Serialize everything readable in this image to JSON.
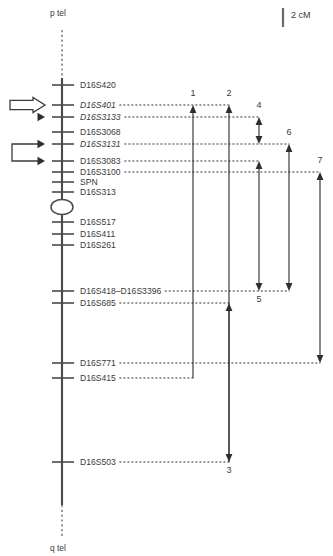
{
  "figure": {
    "type": "genetic-linkage-map",
    "chromosome_arms": {
      "top": "p tel",
      "bottom": "q tel"
    },
    "scale": {
      "label": "2 cM",
      "bar_length_cm": 2
    }
  },
  "chart_data": {
    "type": "diagram",
    "title": "",
    "subtitle": "",
    "xlabel": "",
    "ylabel": "",
    "scale_label": "2 cM",
    "telomere_top": "p tel",
    "telomere_bottom": "q tel",
    "centromere_present": true,
    "markers": [
      {
        "name": "D16S420",
        "y": 85,
        "italic": false,
        "has_leader": false
      },
      {
        "name": "D16S401",
        "y": 105,
        "italic": true,
        "has_leader": true
      },
      {
        "name": "D16S3133",
        "y": 117,
        "italic": true,
        "has_leader": true
      },
      {
        "name": "D16S3068",
        "y": 132,
        "italic": false,
        "has_leader": false
      },
      {
        "name": "D16S3131",
        "y": 144,
        "italic": true,
        "has_leader": true
      },
      {
        "name": "D16S3083",
        "y": 161,
        "italic": false,
        "has_leader": true
      },
      {
        "name": "D16S3100",
        "y": 172,
        "italic": false,
        "has_leader": true
      },
      {
        "name": "SPN",
        "y": 182,
        "italic": false,
        "has_leader": false
      },
      {
        "name": "D16S313",
        "y": 192,
        "italic": false,
        "has_leader": false
      },
      {
        "name": "D16S517",
        "y": 222,
        "italic": false,
        "has_leader": true
      },
      {
        "name": "D16S411",
        "y": 234,
        "italic": false,
        "has_leader": false
      },
      {
        "name": "D16S261",
        "y": 245,
        "italic": false,
        "has_leader": false
      },
      {
        "name": "D16S418–D16S3396",
        "y": 291,
        "italic": false,
        "has_leader": true
      },
      {
        "name": "D16S685",
        "y": 303,
        "italic": false,
        "has_leader": true
      },
      {
        "name": "D16S771",
        "y": 363,
        "italic": false,
        "has_leader": true
      },
      {
        "name": "D16S415",
        "y": 378,
        "italic": false,
        "has_leader": true
      },
      {
        "name": "D16S503",
        "y": 462,
        "italic": false,
        "has_leader": true
      }
    ],
    "intervals": [
      {
        "id": "1",
        "x": 193,
        "top_y": 105,
        "bottom_y": 378,
        "label_y": 96,
        "label_side": "top",
        "top_marker": "D16S401",
        "bottom_marker": "D16S415",
        "heads": "top"
      },
      {
        "id": "2",
        "x": 229,
        "top_y": 105,
        "bottom_y": 462,
        "label_y": 96,
        "label_side": "top",
        "top_marker": "D16S401",
        "bottom_marker": "D16S503",
        "heads": "top"
      },
      {
        "id": "3",
        "x": 229,
        "top_y": 303,
        "bottom_y": 462,
        "label_y": 473,
        "label_side": "bottom",
        "top_marker": "D16S685",
        "bottom_marker": "D16S503",
        "heads": "both"
      },
      {
        "id": "4",
        "x": 259,
        "top_y": 117,
        "bottom_y": 144,
        "label_y": 108,
        "label_side": "top",
        "top_marker": "D16S3133",
        "bottom_marker": "D16S3131",
        "heads": "both"
      },
      {
        "id": "5",
        "x": 259,
        "top_y": 161,
        "bottom_y": 291,
        "label_y": 302,
        "label_side": "bottom",
        "top_marker": "D16S3083",
        "bottom_marker": "D16S418–D16S3396",
        "heads": "both"
      },
      {
        "id": "6",
        "x": 289,
        "top_y": 144,
        "bottom_y": 291,
        "label_y": 135,
        "label_side": "top",
        "top_marker": "D16S3131",
        "bottom_marker": "D16S418–D16S3396",
        "heads": "both"
      },
      {
        "id": "7",
        "x": 320,
        "top_y": 172,
        "bottom_y": 363,
        "label_y": 163,
        "label_side": "top",
        "top_marker": "D16S3100",
        "bottom_marker": "D16S771",
        "heads": "both"
      }
    ],
    "pointer_groups": [
      {
        "id": "pointer-group-upper",
        "style": "block-arrow",
        "targets": [
          "D16S401",
          "D16S3133"
        ],
        "target_ys": [
          105,
          117
        ]
      },
      {
        "id": "pointer-group-lower",
        "style": "bracket-arrow",
        "targets": [
          "D16S3131",
          "D16S3083"
        ],
        "target_ys": [
          144,
          161
        ]
      }
    ],
    "geometry": {
      "axis_x": 62,
      "tick_left": 52,
      "tick_right": 74,
      "label_x": 80,
      "chrom_top_y": 78,
      "chrom_bottom_y": 505,
      "tel_top_y": 30,
      "tel_bottom_y": 538,
      "centromere_y": 207,
      "centromere_rx": 11,
      "centromere_ry": 7.5
    }
  },
  "colors": {
    "ink": "#3a3a3a",
    "line": "#4a4a4a",
    "arrow": "#333333",
    "background": "#ffffff"
  }
}
